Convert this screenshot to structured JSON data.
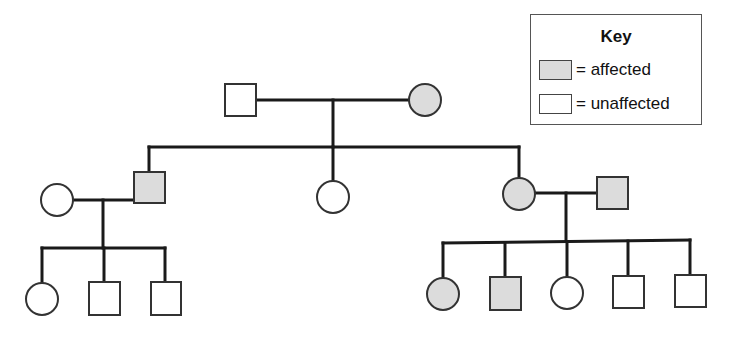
{
  "colors": {
    "affected": "#dcdcdc",
    "unaffected": "#ffffff",
    "line": "#1a1a1a"
  },
  "key": {
    "title": "Key",
    "items": [
      {
        "status": "affected",
        "label": "= affected"
      },
      {
        "status": "unaffected",
        "label": "= unaffected"
      }
    ]
  },
  "pedigree": {
    "generations": [
      {
        "generation": "I",
        "individuals": [
          {
            "id": "I-1",
            "sex": "male",
            "status": "unaffected"
          },
          {
            "id": "I-2",
            "sex": "female",
            "status": "affected"
          }
        ]
      },
      {
        "generation": "II",
        "individuals": [
          {
            "id": "II-1",
            "sex": "female",
            "status": "unaffected",
            "note": "spouse of II-2"
          },
          {
            "id": "II-2",
            "sex": "male",
            "status": "affected",
            "parents": [
              "I-1",
              "I-2"
            ]
          },
          {
            "id": "II-3",
            "sex": "female",
            "status": "unaffected",
            "parents": [
              "I-1",
              "I-2"
            ]
          },
          {
            "id": "II-4",
            "sex": "female",
            "status": "affected",
            "parents": [
              "I-1",
              "I-2"
            ]
          },
          {
            "id": "II-5",
            "sex": "male",
            "status": "affected",
            "note": "spouse of II-4"
          }
        ]
      },
      {
        "generation": "III",
        "individuals": [
          {
            "id": "III-1",
            "sex": "female",
            "status": "unaffected",
            "parents": [
              "II-1",
              "II-2"
            ]
          },
          {
            "id": "III-2",
            "sex": "male",
            "status": "unaffected",
            "parents": [
              "II-1",
              "II-2"
            ]
          },
          {
            "id": "III-3",
            "sex": "male",
            "status": "unaffected",
            "parents": [
              "II-1",
              "II-2"
            ]
          },
          {
            "id": "III-4",
            "sex": "female",
            "status": "affected",
            "parents": [
              "II-4",
              "II-5"
            ]
          },
          {
            "id": "III-5",
            "sex": "male",
            "status": "affected",
            "parents": [
              "II-4",
              "II-5"
            ]
          },
          {
            "id": "III-6",
            "sex": "female",
            "status": "unaffected",
            "parents": [
              "II-4",
              "II-5"
            ]
          },
          {
            "id": "III-7",
            "sex": "male",
            "status": "unaffected",
            "parents": [
              "II-4",
              "II-5"
            ]
          },
          {
            "id": "III-8",
            "sex": "male",
            "status": "unaffected",
            "parents": [
              "II-4",
              "II-5"
            ]
          }
        ]
      }
    ]
  }
}
